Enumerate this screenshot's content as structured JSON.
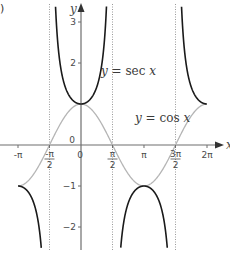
{
  "panel_label": ")",
  "chart_data": {
    "type": "line",
    "title": "",
    "xlabel": "x",
    "ylabel": "y",
    "xlim": [
      -3.45,
      6.6
    ],
    "ylim": [
      -2.6,
      3.4
    ],
    "grid": false,
    "x_ticks": [
      {
        "value": -3.14159,
        "label": "-π"
      },
      {
        "value": -1.5708,
        "label_num": "-π",
        "label_den": "2"
      },
      {
        "value": 0,
        "label": "0"
      },
      {
        "value": 1.5708,
        "label_num": "π",
        "label_den": "2"
      },
      {
        "value": 3.14159,
        "label": "π"
      },
      {
        "value": 4.71239,
        "label_num": "3π",
        "label_den": "2"
      },
      {
        "value": 6.28319,
        "label": "2π"
      }
    ],
    "y_ticks": [
      {
        "value": 3,
        "label": "3"
      },
      {
        "value": 2,
        "label": "2"
      },
      {
        "value": -1,
        "label": "-1"
      },
      {
        "value": -2,
        "label": "-2"
      }
    ],
    "origin_label": "0",
    "asymptotes": [
      -1.5708,
      1.5708,
      4.71239
    ],
    "series": [
      {
        "name": "y = sec x",
        "function": "sec",
        "color": "#1a1a1a",
        "x_range": [
          -3.14159,
          6.28319
        ]
      },
      {
        "name": "y = cos x",
        "function": "cos",
        "color": "#b5b5b5",
        "x_range": [
          -3.14159,
          6.28319
        ]
      }
    ],
    "annotations": [
      {
        "text_prefix": "y",
        "text_rest": " = sec ",
        "text_var": "x",
        "position": "upper middle"
      },
      {
        "text_prefix": "y",
        "text_rest": " = cos ",
        "text_var": "x",
        "position": "right of center"
      }
    ]
  }
}
